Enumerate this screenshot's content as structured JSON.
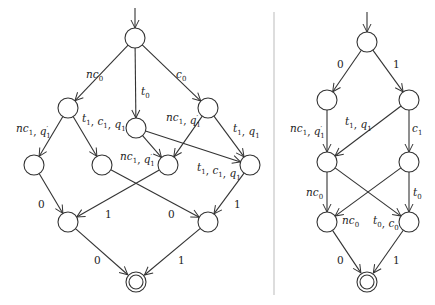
{
  "diagrams": [
    {
      "name": "left-automaton",
      "nodes": [
        {
          "id": "s0",
          "x": 135,
          "y": 38,
          "final": false,
          "initial": true
        },
        {
          "id": "a1",
          "x": 68,
          "y": 108
        },
        {
          "id": "m1",
          "x": 136,
          "y": 128
        },
        {
          "id": "b1",
          "x": 208,
          "y": 108
        },
        {
          "id": "p1",
          "x": 34,
          "y": 165
        },
        {
          "id": "p2",
          "x": 102,
          "y": 165
        },
        {
          "id": "p3",
          "x": 168,
          "y": 165
        },
        {
          "id": "p4",
          "x": 250,
          "y": 165
        },
        {
          "id": "q1",
          "x": 68,
          "y": 222
        },
        {
          "id": "q2",
          "x": 208,
          "y": 222
        },
        {
          "id": "f",
          "x": 136,
          "y": 282,
          "final": true
        }
      ],
      "edges": [
        {
          "from": "s0",
          "to": "a1",
          "label": "nc0",
          "lx": 86,
          "ly": 78
        },
        {
          "from": "s0",
          "to": "m1",
          "label": "t0",
          "lx": 141,
          "ly": 95
        },
        {
          "from": "s0",
          "to": "b1",
          "label": "c0",
          "lx": 176,
          "ly": 78
        },
        {
          "from": "a1",
          "to": "p1",
          "label": "nc1, q1'",
          "lx": 16,
          "ly": 132
        },
        {
          "from": "a1",
          "to": "p2",
          "label": "t1, c1, q1",
          "lx": 82,
          "ly": 122
        },
        {
          "from": "m1",
          "to": "p3",
          "label": "nc1, q1'",
          "lx": 120,
          "ly": 160
        },
        {
          "from": "m1",
          "to": "p4",
          "label": "t1, c1, q1",
          "lx": 197,
          "ly": 171
        },
        {
          "from": "b1",
          "to": "p3",
          "label": "nc1, q1'",
          "lx": 166,
          "ly": 121
        },
        {
          "from": "b1",
          "to": "p4",
          "label": "t1, q1",
          "lx": 233,
          "ly": 132
        },
        {
          "from": "p1",
          "to": "q1",
          "label": "0",
          "lx": 38,
          "ly": 208
        },
        {
          "from": "p3",
          "to": "q1",
          "label": "1",
          "lx": 105,
          "ly": 218
        },
        {
          "from": "p2",
          "to": "q2",
          "label": "0",
          "lx": 168,
          "ly": 218
        },
        {
          "from": "p4",
          "to": "q2",
          "label": "1",
          "lx": 234,
          "ly": 208
        },
        {
          "from": "q1",
          "to": "f",
          "label": "0",
          "lx": 94,
          "ly": 264
        },
        {
          "from": "q2",
          "to": "f",
          "label": "1",
          "lx": 178,
          "ly": 264
        }
      ]
    },
    {
      "name": "right-automaton",
      "nodes": [
        {
          "id": "s0",
          "x": 367,
          "y": 42,
          "initial": true
        },
        {
          "id": "l1",
          "x": 327,
          "y": 100
        },
        {
          "id": "r1",
          "x": 409,
          "y": 100
        },
        {
          "id": "l2",
          "x": 327,
          "y": 162
        },
        {
          "id": "r2",
          "x": 409,
          "y": 162
        },
        {
          "id": "l3",
          "x": 327,
          "y": 222
        },
        {
          "id": "r3",
          "x": 409,
          "y": 222
        },
        {
          "id": "f",
          "x": 367,
          "y": 282,
          "final": true
        }
      ],
      "edges": [
        {
          "from": "s0",
          "to": "l1",
          "label": "0",
          "lx": 337,
          "ly": 68
        },
        {
          "from": "s0",
          "to": "r1",
          "label": "1",
          "lx": 393,
          "ly": 68
        },
        {
          "from": "l1",
          "to": "l2",
          "label": "nc1, q1'",
          "lx": 290,
          "ly": 132
        },
        {
          "from": "r1",
          "to": "l2",
          "label": "t1, q1",
          "lx": 345,
          "ly": 125
        },
        {
          "from": "r1",
          "to": "r2",
          "label": "c1",
          "lx": 412,
          "ly": 132
        },
        {
          "from": "l2",
          "to": "l3",
          "label": "nc0",
          "lx": 306,
          "ly": 196
        },
        {
          "from": "r2",
          "to": "l3",
          "label": "nc0",
          "lx": 342,
          "ly": 224
        },
        {
          "from": "l2",
          "to": "r3",
          "label": "t0, c0",
          "lx": 373,
          "ly": 224
        },
        {
          "from": "r2",
          "to": "r3",
          "label": "t0",
          "lx": 413,
          "ly": 196
        },
        {
          "from": "l3",
          "to": "f",
          "label": "0",
          "lx": 337,
          "ly": 264
        },
        {
          "from": "r3",
          "to": "f",
          "label": "1",
          "lx": 393,
          "ly": 264
        }
      ]
    }
  ]
}
